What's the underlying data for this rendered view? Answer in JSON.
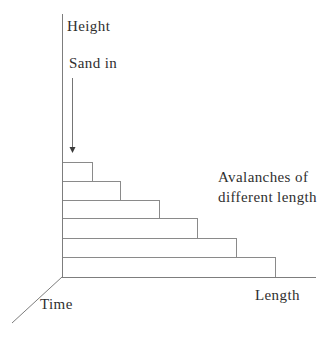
{
  "colors": {
    "background": "#ffffff",
    "line": "#8a8a8a",
    "axis": "#7d7d7d",
    "arrow": "#757575",
    "arrow_head": "#3a3a3a",
    "text": "#2f2f2f"
  },
  "labels": {
    "height_axis": "Height",
    "sand_in": "Sand in",
    "avalanches_note_line1": "Avalanches of",
    "avalanches_note_line2": "different length",
    "length_axis": "Length",
    "time_axis": "Time"
  },
  "diagram": {
    "type": "staircase-sketch",
    "origin": {
      "x": 62,
      "y": 277
    },
    "height_axis": {
      "x": 62,
      "y1": 14,
      "y2": 277
    },
    "length_axis": {
      "y": 277,
      "x1": 62,
      "x2": 316
    },
    "time_axis": {
      "x1": 62,
      "y1": 277,
      "x2": 12,
      "y2": 323
    },
    "sand_arrow": {
      "x": 72,
      "y1": 78,
      "y2": 147,
      "head_half_width": 3,
      "head_length": 6
    },
    "steps": [
      {
        "left": 62,
        "top": 162,
        "bottom": 181,
        "right": 92
      },
      {
        "left": 62,
        "top": 181,
        "bottom": 200,
        "right": 120
      },
      {
        "left": 62,
        "top": 200,
        "bottom": 218,
        "right": 159
      },
      {
        "left": 62,
        "top": 218,
        "bottom": 238,
        "right": 197
      },
      {
        "left": 62,
        "top": 238,
        "bottom": 257,
        "right": 236
      },
      {
        "left": 62,
        "top": 257,
        "bottom": 277,
        "right": 275
      }
    ]
  }
}
